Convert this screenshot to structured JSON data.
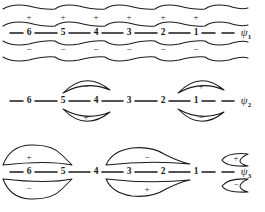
{
  "figure": {
    "stroke_color": "#1a1a1a",
    "background_color": "#ffffff",
    "atom_labels": [
      "6",
      "5",
      "4",
      "3",
      "2",
      "1"
    ],
    "atom_x": [
      29,
      63,
      96,
      129,
      163,
      196
    ],
    "sign_plus": "+",
    "sign_minus": "−",
    "rows": [
      {
        "id": "psi1",
        "orbital_label": "ψ",
        "orbital_subscript": "1",
        "axis_y": 33,
        "label_x": 246,
        "nodes": 0,
        "lobe_style": "continuous-wavy",
        "top_signs": [
          "+",
          "+",
          "+",
          "+",
          "+",
          "+"
        ],
        "bottom_signs": [
          "−",
          "−",
          "−",
          "−",
          "−",
          "−"
        ],
        "top_sign_y": 17,
        "bottom_sign_y": 49
      },
      {
        "id": "psi2",
        "orbital_label": "ψ",
        "orbital_subscript": "2",
        "axis_y": 101,
        "label_x": 246,
        "nodes": 1,
        "lobe_style": "two-lens-pairs",
        "lobes": [
          {
            "center_x": 85,
            "side": "top",
            "sign": "−"
          },
          {
            "center_x": 85,
            "side": "bottom",
            "sign": "+"
          },
          {
            "center_x": 200,
            "side": "top",
            "sign": "+"
          },
          {
            "center_x": 200,
            "side": "bottom",
            "sign": "−"
          }
        ]
      },
      {
        "id": "psi3",
        "orbital_label": "ψ",
        "orbital_subscript": "3",
        "axis_y": 172,
        "label_x": 246,
        "nodes": 2,
        "lobe_style": "three-irregular-groups",
        "lobes": [
          {
            "center_x": 38,
            "side": "top",
            "sign": "+"
          },
          {
            "center_x": 38,
            "side": "bottom",
            "sign": "−"
          },
          {
            "center_x": 147,
            "side": "top",
            "sign": "−"
          },
          {
            "center_x": 147,
            "side": "bottom",
            "sign": "+"
          },
          {
            "center_x": 232,
            "side": "top",
            "sign": "+"
          },
          {
            "center_x": 232,
            "side": "bottom",
            "sign": "−"
          }
        ]
      }
    ]
  }
}
